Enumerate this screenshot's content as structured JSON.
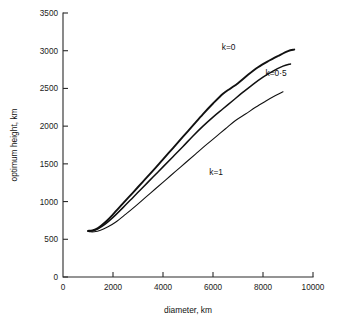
{
  "chart_data": {
    "type": "line",
    "title": "",
    "xlabel": "diameter, km",
    "ylabel": "optimum height, km",
    "xlim": [
      0,
      10000
    ],
    "ylim": [
      0,
      3500
    ],
    "xticks": [
      0,
      2000,
      4000,
      6000,
      8000,
      10000
    ],
    "yticks": [
      0,
      500,
      1000,
      1500,
      2000,
      2500,
      3000,
      3500
    ],
    "xtick_labels": [
      "0",
      "2000",
      "4000",
      "6000",
      "8000",
      "10000"
    ],
    "ytick_labels": [
      "0",
      "500",
      "1000",
      "1500",
      "2000",
      "2500",
      "3000",
      "3500"
    ],
    "grid": false,
    "legend_position": "inline-annotations",
    "series": [
      {
        "name": "k=0",
        "label": "k=0",
        "color": "#111111",
        "stroke_width": 1.9,
        "label_x": 6350,
        "label_y": 3010,
        "x": [
          1000,
          1180,
          1400,
          1700,
          2000,
          2400,
          2800,
          3200,
          3600,
          4000,
          4400,
          4800,
          5200,
          5600,
          6000,
          6400,
          6700,
          7000,
          7400,
          7800,
          8200,
          8600,
          9000,
          9250
        ],
        "y": [
          612,
          618,
          650,
          730,
          830,
          975,
          1120,
          1265,
          1410,
          1560,
          1710,
          1860,
          2010,
          2160,
          2300,
          2430,
          2500,
          2570,
          2680,
          2780,
          2860,
          2930,
          2995,
          3015
        ]
      },
      {
        "name": "k=0·5",
        "label": "k=0·5",
        "color": "#111111",
        "stroke_width": 1.5,
        "label_x": 8100,
        "label_y": 2665,
        "x": [
          1000,
          1180,
          1400,
          1700,
          2000,
          2400,
          2800,
          3200,
          3600,
          4000,
          4400,
          4800,
          5200,
          5600,
          6000,
          6400,
          6800,
          7200,
          7600,
          8000,
          8400,
          8800,
          9100
        ],
        "y": [
          608,
          612,
          640,
          705,
          790,
          920,
          1055,
          1190,
          1325,
          1460,
          1595,
          1730,
          1870,
          2000,
          2120,
          2230,
          2340,
          2450,
          2555,
          2650,
          2730,
          2795,
          2825
        ]
      },
      {
        "name": "k=1",
        "label": "k=1",
        "color": "#111111",
        "stroke_width": 1.1,
        "label_x": 5850,
        "label_y": 1350,
        "x": [
          1050,
          1250,
          1500,
          1800,
          2100,
          2500,
          2900,
          3300,
          3700,
          4100,
          4500,
          4900,
          5300,
          5700,
          6100,
          6500,
          6900,
          7300,
          7700,
          8100,
          8500,
          8800
        ],
        "y": [
          600,
          600,
          620,
          665,
          725,
          830,
          940,
          1055,
          1170,
          1285,
          1400,
          1515,
          1630,
          1745,
          1855,
          1965,
          2075,
          2160,
          2250,
          2330,
          2405,
          2455
        ]
      }
    ]
  },
  "plot": {
    "left": 63,
    "right": 313,
    "top": 13,
    "bottom": 277
  },
  "caption": {
    "ghost_text": ""
  }
}
